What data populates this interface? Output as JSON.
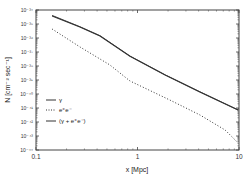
{
  "chart_data": {
    "type": "line",
    "title": "",
    "xlabel": "x [Mpc]",
    "ylabel": "N [cm⁻² sec⁻¹]",
    "xscale": "log",
    "yscale": "log",
    "xlim": [
      0.1,
      10
    ],
    "ylim": [
      1e-44,
      1e-34
    ],
    "x_ticks": [
      "0.1",
      "1",
      "10"
    ],
    "y_ticks": [
      "10⁻³⁴",
      "10⁻³⁵",
      "10⁻³⁶",
      "10⁻³⁷",
      "10⁻³⁸",
      "10⁻³⁹",
      "10⁻⁴⁰",
      "10⁻⁴¹",
      "10⁻⁴²",
      "10⁻⁴³",
      "10⁻⁴⁴"
    ],
    "grid": false,
    "legend_position": "lower left (inside)",
    "series": [
      {
        "name": "γ",
        "style": "solid",
        "x": [
          0.144,
          0.271,
          0.427,
          0.844,
          1.87,
          4.11,
          9.8
        ],
        "y": [
          3.7e-35,
          6.2e-36,
          1.4e-36,
          5e-38,
          2.3e-39,
          1.4e-40,
          7.2e-42
        ]
      },
      {
        "name": "e⁺e⁻",
        "style": "dotted",
        "x": [
          0.144,
          0.271,
          0.534,
          0.844,
          2.08,
          4.11,
          7.3,
          9.8
        ],
        "y": [
          4.4e-36,
          2.3e-37,
          1.2e-38,
          8.5e-40,
          3.7e-41,
          3.2e-42,
          2.7e-43,
          3.2e-44
        ]
      },
      {
        "name": "(γ + e⁺e⁻)",
        "style": "solid",
        "x": [
          0.144,
          0.271,
          0.427,
          0.844,
          1.87,
          4.11,
          9.8
        ],
        "y": [
          4.1e-35,
          6.4e-36,
          1.45e-36,
          5.1e-38,
          2.35e-39,
          1.45e-40,
          7.3e-42
        ]
      }
    ]
  },
  "legend": {
    "items": [
      {
        "label": "γ",
        "style": "solid"
      },
      {
        "label": "e⁺e⁻",
        "style": "dotted"
      },
      {
        "label": "(γ + e⁺e⁻)",
        "style": "solid"
      }
    ]
  },
  "colors": {
    "line": "#333333",
    "axis": "#444444"
  }
}
